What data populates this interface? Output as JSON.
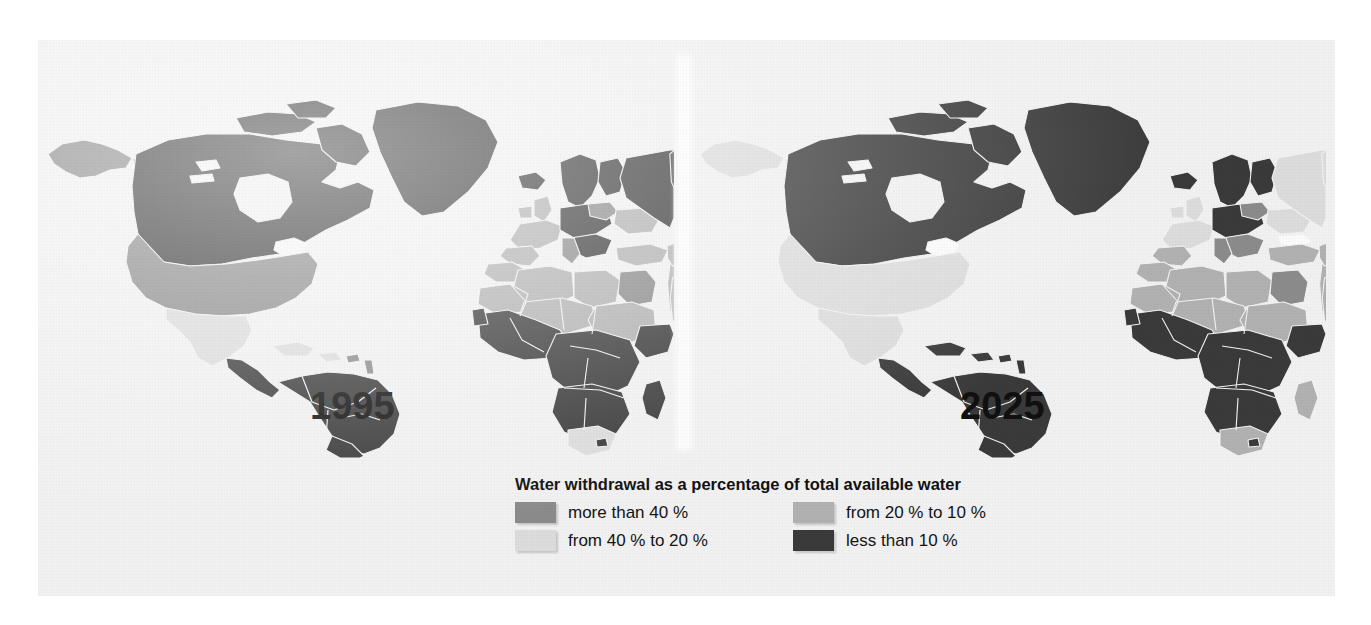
{
  "figure": {
    "kind": "choropleth-map-pair",
    "background_color": "#f1f1f1",
    "panels": [
      {
        "id": "left",
        "year_label": "1995"
      },
      {
        "id": "right",
        "year_label": "2025"
      }
    ]
  },
  "legend": {
    "title": "Water withdrawal as a percentage of total available water",
    "items": [
      {
        "label": "more than 40 %",
        "color": "#8b8b8b",
        "column": 1,
        "row": 1
      },
      {
        "label": "from 40 % to 20 %",
        "color": "#dcdcdc",
        "column": 1,
        "row": 2
      },
      {
        "label": "from 20 % to 10 %",
        "color": "#b1b1b1",
        "column": 2,
        "row": 1
      },
      {
        "label": "less than 10 %",
        "color": "#3a3a3a",
        "column": 2,
        "row": 2
      }
    ]
  },
  "chart_data": {
    "type": "heatmap",
    "title": "Water withdrawal as a percentage of total available water",
    "subtitle": "",
    "xlabel": "",
    "ylabel": "",
    "legend_position": "bottom-center",
    "grid": false,
    "categories": [
      "more than 40 %",
      "from 40 % to 20 %",
      "from 20 % to 10 %",
      "less than 10 %"
    ],
    "category_colors": [
      "#8b8b8b",
      "#dcdcdc",
      "#b1b1b1",
      "#3a3a3a"
    ],
    "panels": [
      "1995",
      "2025"
    ],
    "series": [
      {
        "name": "1995",
        "regions": [
          {
            "region": "Canada",
            "class": "less than 10 %"
          },
          {
            "region": "Alaska",
            "class": "more than 40 %"
          },
          {
            "region": "United States",
            "class": "more than 40 %"
          },
          {
            "region": "Mexico",
            "class": "from 40 % to 20 %"
          },
          {
            "region": "Central America",
            "class": "less than 10 %"
          },
          {
            "region": "Caribbean",
            "class": "from 40 % to 20 %"
          },
          {
            "region": "South America",
            "class": "less than 10 %"
          },
          {
            "region": "Greenland",
            "class": "less than 10 %"
          },
          {
            "region": "Iceland",
            "class": "less than 10 %"
          },
          {
            "region": "Scandinavia",
            "class": "less than 10 %"
          },
          {
            "region": "Western Europe",
            "class": "from 20 % to 10 %"
          },
          {
            "region": "Central Europe",
            "class": "more than 40 %"
          },
          {
            "region": "Russia",
            "class": "less than 10 %"
          },
          {
            "region": "Kazakhstan / Central Asia",
            "class": "from 20 % to 10 %"
          },
          {
            "region": "North Africa",
            "class": "from 20 % to 10 %"
          },
          {
            "region": "Sahel",
            "class": "from 20 % to 10 %"
          },
          {
            "region": "West Africa",
            "class": "less than 10 %"
          },
          {
            "region": "Central Africa",
            "class": "less than 10 %"
          },
          {
            "region": "East Africa",
            "class": "less than 10 %"
          },
          {
            "region": "Southern Africa",
            "class": "less than 10 %"
          },
          {
            "region": "South Africa",
            "class": "from 40 % to 20 %"
          },
          {
            "region": "Madagascar",
            "class": "less than 10 %"
          },
          {
            "region": "Middle East",
            "class": "from 20 % to 10 %"
          },
          {
            "region": "Iran",
            "class": "from 20 % to 10 %"
          },
          {
            "region": "India",
            "class": "from 20 % to 10 %"
          },
          {
            "region": "Pakistan",
            "class": "more than 40 %"
          },
          {
            "region": "China",
            "class": "from 20 % to 10 %"
          },
          {
            "region": "Mongolia",
            "class": "from 20 % to 10 %"
          },
          {
            "region": "Southeast Asia",
            "class": "less than 10 %"
          },
          {
            "region": "Indonesia",
            "class": "less than 10 %"
          },
          {
            "region": "Japan",
            "class": "from 20 % to 10 %"
          },
          {
            "region": "Australia",
            "class": "less than 10 %"
          },
          {
            "region": "New Zealand",
            "class": "less than 10 %"
          }
        ]
      },
      {
        "name": "2025",
        "regions": [
          {
            "region": "Canada",
            "class": "less than 10 %"
          },
          {
            "region": "Alaska",
            "class": "from 40 % to 20 %"
          },
          {
            "region": "United States",
            "class": "from 40 % to 20 %"
          },
          {
            "region": "Mexico",
            "class": "from 40 % to 20 %"
          },
          {
            "region": "Central America",
            "class": "less than 10 %"
          },
          {
            "region": "Caribbean",
            "class": "less than 10 %"
          },
          {
            "region": "South America",
            "class": "less than 10 %"
          },
          {
            "region": "Greenland",
            "class": "less than 10 %"
          },
          {
            "region": "Iceland",
            "class": "less than 10 %"
          },
          {
            "region": "Scandinavia",
            "class": "less than 10 %"
          },
          {
            "region": "Western Europe",
            "class": "from 40 % to 20 %"
          },
          {
            "region": "Central Europe",
            "class": "more than 40 %"
          },
          {
            "region": "Russia",
            "class": "from 40 % to 20 %"
          },
          {
            "region": "Kazakhstan / Central Asia",
            "class": "from 40 % to 20 %"
          },
          {
            "region": "North Africa",
            "class": "from 20 % to 10 %"
          },
          {
            "region": "Sahel",
            "class": "from 40 % to 20 %"
          },
          {
            "region": "West Africa",
            "class": "less than 10 %"
          },
          {
            "region": "Central Africa",
            "class": "less than 10 %"
          },
          {
            "region": "East Africa",
            "class": "less than 10 %"
          },
          {
            "region": "Southern Africa",
            "class": "less than 10 %"
          },
          {
            "region": "South Africa",
            "class": "from 20 % to 10 %"
          },
          {
            "region": "Madagascar",
            "class": "from 20 % to 10 %"
          },
          {
            "region": "Middle East",
            "class": "from 20 % to 10 %"
          },
          {
            "region": "Iran",
            "class": "from 20 % to 10 %"
          },
          {
            "region": "India",
            "class": "from 20 % to 10 %"
          },
          {
            "region": "Pakistan",
            "class": "more than 40 %"
          },
          {
            "region": "China",
            "class": "from 40 % to 20 %"
          },
          {
            "region": "Mongolia",
            "class": "from 40 % to 20 %"
          },
          {
            "region": "Southeast Asia",
            "class": "less than 10 %"
          },
          {
            "region": "Indonesia",
            "class": "less than 10 %"
          },
          {
            "region": "Japan",
            "class": "from 20 % to 10 %"
          },
          {
            "region": "Australia",
            "class": "less than 10 %"
          },
          {
            "region": "New Zealand",
            "class": "less than 10 %"
          }
        ]
      }
    ]
  }
}
